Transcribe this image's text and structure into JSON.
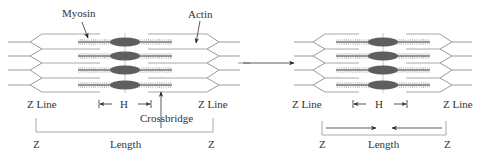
{
  "diagram": {
    "relaxed": {
      "labels": {
        "myosin": "Myosin",
        "actin": "Actin",
        "z_line_left": "Z Line",
        "z_line_right": "Z Line",
        "h_zone": "H",
        "crossbridge": "Crossbridge",
        "z_left": "Z",
        "length": "Length",
        "z_right": "Z"
      }
    },
    "contracted": {
      "labels": {
        "z_line_left": "Z Line",
        "z_line_right": "Z Line",
        "h_zone": "H",
        "z_left": "Z",
        "length": "Length",
        "z_right": "Z"
      }
    },
    "transition_arrow": "relaxed-to-contracted",
    "colors": {
      "myosin_head": "#5e5e5e",
      "filament": "#9a9a9a",
      "text": "#333333",
      "background": "#ffffff"
    }
  }
}
